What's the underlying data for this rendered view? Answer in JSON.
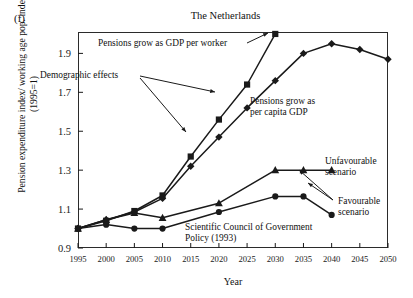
{
  "panel_label": "(f)",
  "chart_data": {
    "type": "line",
    "title": "The Netherlands",
    "xlabel": "Year",
    "ylabel": "Pension expenditure index/ working age pop. index (1995=1)",
    "x": [
      1995,
      2000,
      2005,
      2010,
      2015,
      2020,
      2025,
      2030,
      2035,
      2040,
      2045,
      2050
    ],
    "xlim": [
      1995,
      2050
    ],
    "ylim": [
      0.9,
      2.01
    ],
    "yticks": [
      0.9,
      1.1,
      1.3,
      1.5,
      1.7,
      1.9
    ],
    "xticks": [
      1995,
      2000,
      2005,
      2010,
      2015,
      2020,
      2025,
      2030,
      2035,
      2040,
      2045,
      2050
    ],
    "grid": false,
    "legend": "annotations",
    "series": [
      {
        "name": "Pensions grow as GDP per worker",
        "marker": "square",
        "x": [
          1995,
          2000,
          2005,
          2010,
          2015,
          2020,
          2025,
          2030
        ],
        "values": [
          1.0,
          1.04,
          1.09,
          1.17,
          1.37,
          1.56,
          1.74,
          2.0
        ]
      },
      {
        "name": "Pensions grow as per capita GDP",
        "marker": "diamond",
        "x": [
          1995,
          2000,
          2005,
          2010,
          2015,
          2020,
          2025,
          2030,
          2035,
          2040,
          2045,
          2050
        ],
        "values": [
          1.0,
          1.045,
          1.085,
          1.155,
          1.32,
          1.47,
          1.62,
          1.76,
          1.9,
          1.95,
          1.92,
          1.87
        ]
      },
      {
        "name": "Unfavourable scenario",
        "marker": "triangle",
        "x": [
          1995,
          2000,
          2005,
          2010,
          2020,
          2030,
          2035,
          2040
        ],
        "values": [
          1.0,
          1.045,
          1.08,
          1.055,
          1.13,
          1.3,
          1.3,
          1.3
        ]
      },
      {
        "name": "Favourable scenario",
        "marker": "circle",
        "x": [
          1995,
          2000,
          2005,
          2010,
          2020,
          2030,
          2035,
          2040
        ],
        "values": [
          1.0,
          1.02,
          1.0,
          1.0,
          1.085,
          1.165,
          1.165,
          1.07
        ]
      }
    ],
    "annotations": [
      {
        "id": "worker",
        "text": "Pensions grow as GDP per worker"
      },
      {
        "id": "demographic",
        "text": "Demographic effects"
      },
      {
        "id": "capita_line1",
        "text": "Pensions grow as"
      },
      {
        "id": "capita_line2",
        "text": "per capita GDP"
      },
      {
        "id": "unfav_line1",
        "text": "Unfavourable"
      },
      {
        "id": "unfav_line2",
        "text": "scenario"
      },
      {
        "id": "fav_line1",
        "text": "Favourable"
      },
      {
        "id": "fav_line2",
        "text": "scenario"
      },
      {
        "id": "council_line1",
        "text": "Scientific Council of Government"
      },
      {
        "id": "council_line2",
        "text": "Policy (1993)"
      }
    ],
    "colors": {
      "ink": "#1a1a1a",
      "background": "#ffffff"
    }
  }
}
